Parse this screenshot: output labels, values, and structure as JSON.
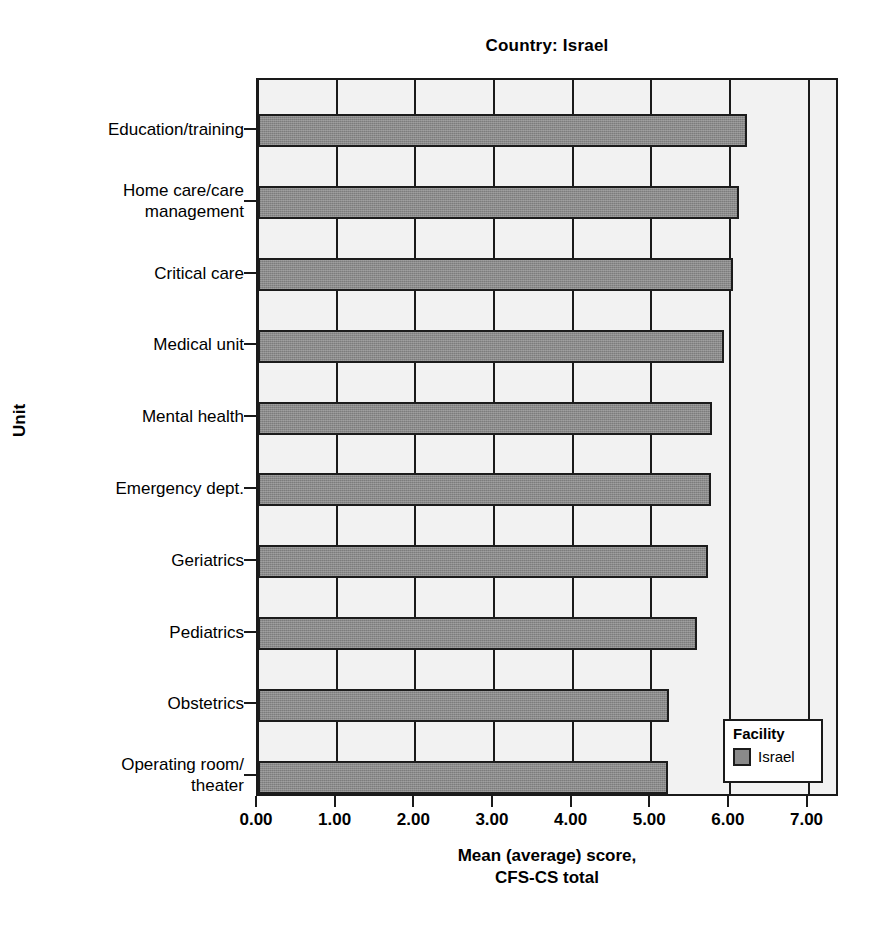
{
  "chart_data": {
    "type": "bar",
    "orientation": "horizontal",
    "title": "Country: Israel",
    "xlabel": "Mean (average) score,\nCFS-CS total",
    "ylabel": "Unit",
    "xlim": [
      0.0,
      7.4
    ],
    "xticks": [
      "0.00",
      "1.00",
      "2.00",
      "3.00",
      "4.00",
      "5.00",
      "6.00",
      "7.00"
    ],
    "xtick_values": [
      0,
      1,
      2,
      3,
      4,
      5,
      6,
      7
    ],
    "grid": true,
    "grid_axis": "x",
    "categories": [
      "Education/training",
      "Home care/care\nmanagement",
      "Critical care",
      "Medical unit",
      "Mental health",
      "Emergency dept.",
      "Geriatrics",
      "Pediatrics",
      "Obstetrics",
      "Operating room/\ntheater"
    ],
    "values": [
      6.22,
      6.12,
      6.04,
      5.92,
      5.77,
      5.76,
      5.72,
      5.58,
      5.22,
      5.21
    ],
    "series": [
      {
        "name": "Israel",
        "color": "#8a8a8a",
        "values": [
          6.22,
          6.12,
          6.04,
          5.92,
          5.77,
          5.76,
          5.72,
          5.58,
          5.22,
          5.21
        ]
      }
    ],
    "legend": {
      "title": "Facility",
      "position": "bottom-right",
      "entries": [
        {
          "label": "Israel",
          "color": "#8a8a8a"
        }
      ]
    },
    "colors": {
      "bar_fill": "#8a8a8a",
      "bar_edge": "#1c1c1c",
      "plot_background": "#f2f2f2",
      "frame": "#1a1a1a",
      "text": "#000000"
    }
  }
}
